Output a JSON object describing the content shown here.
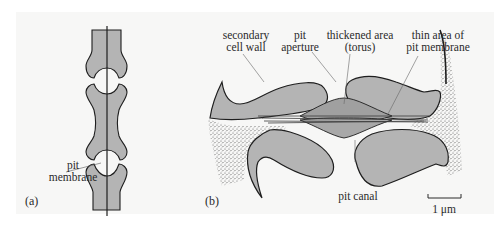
{
  "figure": {
    "panels": [
      {
        "tag": "(a)",
        "labels": {
          "pit_membrane_line1": "pit",
          "pit_membrane_line2": "membrane"
        }
      },
      {
        "tag": "(b)",
        "labels": {
          "secondary_wall_line1": "secondary",
          "secondary_wall_line2": "cell wall",
          "pit_aperture_line1": "pit",
          "pit_aperture_line2": "aperture",
          "torus_line1": "thickened area",
          "torus_line2": "(torus)",
          "thin_area_line1": "thin area of",
          "thin_area_line2": "pit membrane",
          "pit_canal": "pit canal"
        },
        "scale_bar": {
          "label": "1 μm"
        }
      }
    ],
    "colors": {
      "background": "#f7f7f6",
      "wall_fill": "#b4b4b4",
      "outline": "#1e1e1e",
      "stipple": "#555555"
    }
  }
}
